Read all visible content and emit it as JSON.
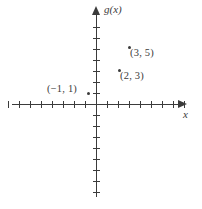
{
  "figure": {
    "axes": {
      "x_label": "x",
      "y_label": "g(x)",
      "origin_px": {
        "x": 96,
        "y": 104
      },
      "tick_spacing_px": 11,
      "x_ticks_left": 8,
      "x_ticks_right": 8,
      "y_ticks_above": 7,
      "y_ticks_below": 8,
      "axis_color": "#3b3b3b"
    },
    "points": [
      {
        "name": "point-neg1-1",
        "label": "(−1, 1)",
        "x": -1,
        "y": 1,
        "dot_px": {
          "x": 87,
          "y": 92
        },
        "label_px": {
          "x": 47,
          "y": 83
        }
      },
      {
        "name": "point-2-3",
        "label": "(2, 3)",
        "x": 2,
        "y": 3,
        "dot_px": {
          "x": 118,
          "y": 69
        },
        "label_px": {
          "x": 120,
          "y": 70
        }
      },
      {
        "name": "point-3-5",
        "label": "(3, 5)",
        "x": 3,
        "y": 5,
        "dot_px": {
          "x": 128,
          "y": 46
        },
        "label_px": {
          "x": 130,
          "y": 47
        }
      }
    ]
  },
  "chart_data": {
    "type": "scatter",
    "title": "",
    "xlabel": "x",
    "ylabel": "g(x)",
    "grid": false,
    "legend": "none",
    "xlim": [
      -8,
      8
    ],
    "ylim": [
      -8,
      7
    ],
    "points": [
      {
        "x": -1,
        "y": 1,
        "label": "(−1, 1)"
      },
      {
        "x": 2,
        "y": 3,
        "label": "(2, 3)"
      },
      {
        "x": 3,
        "y": 5,
        "label": "(3, 5)"
      }
    ]
  }
}
